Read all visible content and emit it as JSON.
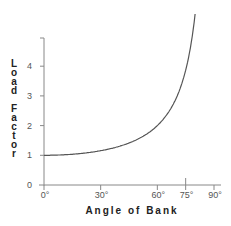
{
  "chart_data": {
    "type": "line",
    "title": "",
    "xlabel": "Angle of Bank",
    "ylabel": "Load Factor",
    "x_ticks": [
      0,
      30,
      60,
      75,
      90
    ],
    "x_tick_labels": [
      "0°",
      "30°",
      "60°",
      "75°",
      "90°"
    ],
    "y_ticks": [
      0,
      1,
      2,
      3,
      4
    ],
    "y_tick_labels": [
      "0",
      "1",
      "2",
      "3",
      "4"
    ],
    "xlim": [
      0,
      90
    ],
    "ylim": [
      0,
      6
    ],
    "grid": false,
    "legend": null,
    "highlighted_tick": "75°",
    "series": [
      {
        "name": "Load Factor = 1/cos(bank angle)",
        "x": [
          0,
          10,
          20,
          30,
          40,
          45,
          50,
          55,
          60,
          65,
          70,
          75,
          78,
          80
        ],
        "y": [
          1.0,
          1.02,
          1.06,
          1.15,
          1.31,
          1.41,
          1.56,
          1.74,
          2.0,
          2.37,
          2.92,
          3.86,
          4.81,
          5.76
        ]
      }
    ]
  },
  "labels": {
    "xlabel": "Angle of Bank",
    "ylabel_line1": "Load",
    "ylabel_line2": "Factor"
  },
  "colors": {
    "axis": "#888888",
    "curve": "#555555",
    "text": "#222222"
  }
}
